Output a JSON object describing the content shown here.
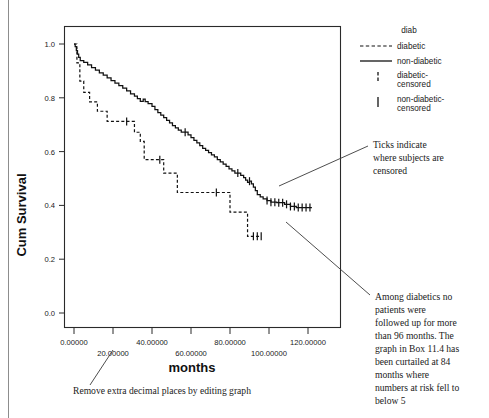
{
  "figure": {
    "axis": {
      "y_label": "Cum Survival",
      "x_label": "months",
      "y_ticks": [
        "0.0",
        "0.2",
        "0.4",
        "0.6",
        "0.8",
        "1.0"
      ],
      "x_ticks_upper": [
        "0.00000",
        "40.00000",
        "80.00000",
        "120.00000"
      ],
      "x_ticks_lower": [
        "20.00000",
        "60.00000",
        "100.00000"
      ]
    },
    "legend": {
      "title": "diab",
      "items": [
        {
          "label": "diabetic",
          "style": "dashed-line"
        },
        {
          "label": "non-diabetic",
          "style": "solid-line"
        },
        {
          "label": "diabetic-\ncensored",
          "line1": "diabetic-",
          "line2": "censored",
          "style": "dashed-tick"
        },
        {
          "label": "non-diabetic-\ncensored",
          "line1": "non-diabetic-",
          "line2": "censored",
          "style": "solid-tick"
        }
      ]
    },
    "annotations": [
      {
        "name": "ticks-note",
        "lines": [
          "Ticks indicate",
          "where subjects are",
          "censored"
        ]
      },
      {
        "name": "followup-note",
        "lines": [
          "Among diabetics no",
          "patients were",
          "followed up for more",
          "than 96 months. The",
          "graph in Box 11.4 has",
          "been curtailed at 84",
          "months where",
          "numbers at risk fell to",
          "below 5"
        ]
      },
      {
        "name": "decimals-note",
        "lines": [
          "Remove extra decimal places by editing graph"
        ]
      }
    ],
    "colors": {
      "line": "#111111",
      "frame": "#2a2a2a",
      "leader": "#3a3a3a",
      "margin_rule": "#8d8d8d"
    }
  },
  "chart_data": {
    "type": "line",
    "subtype": "kaplan-meier-survival-step",
    "title": "",
    "xlabel": "months",
    "ylabel": "Cum Survival",
    "xlim": [
      -4,
      128
    ],
    "ylim": [
      0.0,
      1.05
    ],
    "xticks": [
      0,
      20,
      40,
      60,
      80,
      100,
      120
    ],
    "yticks": [
      0.0,
      0.2,
      0.4,
      0.6,
      0.8,
      1.0
    ],
    "grid": false,
    "legend_position": "right",
    "series": [
      {
        "name": "non-diabetic",
        "style": "solid",
        "points": [
          [
            0,
            1.0
          ],
          [
            0.6,
            0.99
          ],
          [
            1.2,
            0.975
          ],
          [
            1.8,
            0.962
          ],
          [
            2.4,
            0.95
          ],
          [
            3.2,
            0.938
          ],
          [
            5.0,
            0.932
          ],
          [
            7.0,
            0.922
          ],
          [
            9.0,
            0.912
          ],
          [
            11.0,
            0.903
          ],
          [
            13.0,
            0.893
          ],
          [
            15.0,
            0.884
          ],
          [
            17.0,
            0.874
          ],
          [
            19.0,
            0.864
          ],
          [
            21.0,
            0.855
          ],
          [
            23.0,
            0.845
          ],
          [
            25.0,
            0.836
          ],
          [
            27.0,
            0.826
          ],
          [
            29.0,
            0.815
          ],
          [
            31.0,
            0.806
          ],
          [
            32.5,
            0.797
          ],
          [
            34.0,
            0.787
          ],
          [
            35.5,
            0.795
          ],
          [
            36.5,
            0.786
          ],
          [
            38.0,
            0.778
          ],
          [
            40.0,
            0.768
          ],
          [
            41.5,
            0.756
          ],
          [
            43.0,
            0.745
          ],
          [
            44.5,
            0.736
          ],
          [
            46.0,
            0.726
          ],
          [
            47.5,
            0.716
          ],
          [
            49.0,
            0.707
          ],
          [
            50.5,
            0.697
          ],
          [
            52.0,
            0.688
          ],
          [
            53.5,
            0.68
          ],
          [
            55.0,
            0.672
          ],
          [
            57.0,
            0.672
          ],
          [
            58.5,
            0.662
          ],
          [
            60.0,
            0.652
          ],
          [
            61.5,
            0.642
          ],
          [
            63.0,
            0.632
          ],
          [
            64.5,
            0.622
          ],
          [
            66.0,
            0.612
          ],
          [
            67.5,
            0.605
          ],
          [
            69.0,
            0.596
          ],
          [
            70.5,
            0.588
          ],
          [
            72.0,
            0.58
          ],
          [
            73.5,
            0.57
          ],
          [
            75.0,
            0.562
          ],
          [
            76.5,
            0.553
          ],
          [
            78.0,
            0.545
          ],
          [
            79.5,
            0.536
          ],
          [
            81.0,
            0.528
          ],
          [
            82.5,
            0.52
          ],
          [
            84.0,
            0.52
          ],
          [
            85.5,
            0.512
          ],
          [
            87.0,
            0.503
          ],
          [
            88.0,
            0.494
          ],
          [
            89.0,
            0.486
          ],
          [
            90.0,
            0.49
          ],
          [
            91.0,
            0.48
          ],
          [
            92.0,
            0.468
          ],
          [
            93.0,
            0.455
          ],
          [
            94.0,
            0.44
          ],
          [
            95.5,
            0.432
          ],
          [
            97.0,
            0.424
          ],
          [
            99.0,
            0.418
          ],
          [
            101.0,
            0.412
          ],
          [
            104.0,
            0.41
          ],
          [
            108.0,
            0.404
          ],
          [
            111.0,
            0.396
          ],
          [
            114.0,
            0.392
          ],
          [
            122.0,
            0.392
          ]
        ],
        "censored_months": [
          57,
          84,
          90,
          99,
          101,
          103,
          105,
          107,
          109,
          111,
          113,
          115,
          117,
          119,
          121
        ]
      },
      {
        "name": "diabetic",
        "style": "dashed",
        "points": [
          [
            0,
            1.0
          ],
          [
            1.5,
            1.0
          ],
          [
            1.5,
            0.93
          ],
          [
            3.0,
            0.93
          ],
          [
            3.0,
            0.862
          ],
          [
            5.0,
            0.862
          ],
          [
            5.0,
            0.82
          ],
          [
            8.0,
            0.82
          ],
          [
            8.0,
            0.785
          ],
          [
            12.0,
            0.785
          ],
          [
            12.0,
            0.75
          ],
          [
            17.0,
            0.75
          ],
          [
            17.0,
            0.712
          ],
          [
            27.0,
            0.712
          ],
          [
            27.0,
            0.712
          ],
          [
            31.0,
            0.712
          ],
          [
            31.0,
            0.672
          ],
          [
            34.0,
            0.672
          ],
          [
            34.0,
            0.638
          ],
          [
            36.0,
            0.638
          ],
          [
            36.0,
            0.57
          ],
          [
            44.0,
            0.57
          ],
          [
            44.0,
            0.57
          ],
          [
            46.0,
            0.57
          ],
          [
            46.0,
            0.52
          ],
          [
            53.0,
            0.52
          ],
          [
            53.0,
            0.448
          ],
          [
            73.0,
            0.448
          ],
          [
            73.0,
            0.448
          ],
          [
            80.0,
            0.448
          ],
          [
            80.0,
            0.375
          ],
          [
            89.0,
            0.375
          ],
          [
            89.0,
            0.285
          ],
          [
            96.0,
            0.285
          ]
        ],
        "censored_months": [
          27,
          44,
          73,
          92,
          94,
          96
        ]
      }
    ],
    "notes": [
      "Ticks indicate where subjects are censored",
      "Among diabetics no patients were followed up for more than 96 months. The graph in Box 11.4 has been curtailed at 84 months where numbers at risk fell to below 5",
      "Remove extra decimal places by editing graph"
    ]
  }
}
